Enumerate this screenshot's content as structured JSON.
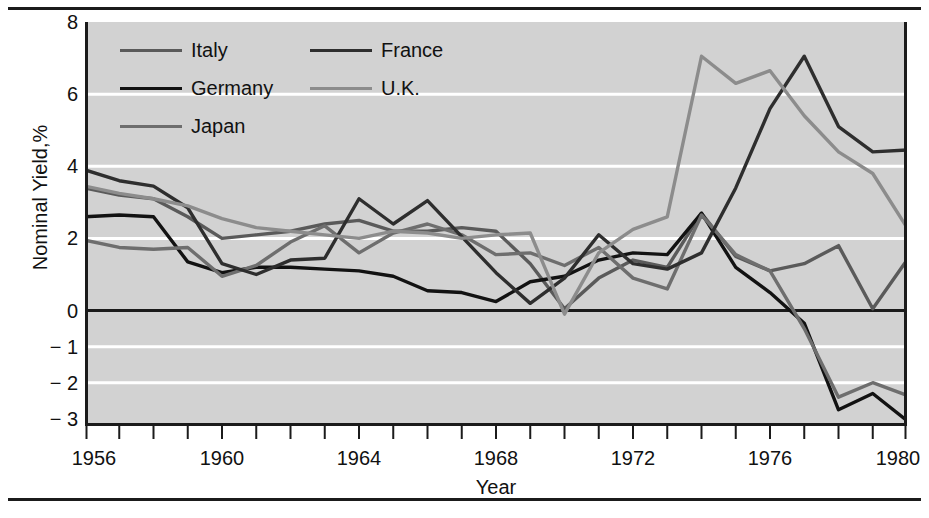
{
  "figure": {
    "background": "#ffffff",
    "plot_background": "#d2d2d2",
    "rule_color": "#1b1b1b"
  },
  "axes": {
    "ylabel": "Nominal Yield,%",
    "xlabel": "Year",
    "yticks": [
      "8",
      "6",
      "4",
      "2",
      "0",
      "− 1",
      "− 2",
      "− 3"
    ],
    "ytick_values": [
      8,
      6,
      4,
      2,
      0,
      -1,
      -2,
      -3
    ],
    "xticks": [
      "1956",
      "1960",
      "1964",
      "1968",
      "1972",
      "1976",
      "1980"
    ],
    "xtick_values": [
      1956,
      1960,
      1964,
      1968,
      1972,
      1976,
      1980
    ],
    "gridline_values": [
      6,
      4,
      2,
      -1,
      -2
    ],
    "zero_line_value": 0
  },
  "legend": {
    "entries": [
      {
        "label": "Italy",
        "color": "#5a5a5a",
        "width": 3.2,
        "column": 0,
        "row": 0
      },
      {
        "label": "Germany",
        "color": "#121212",
        "width": 3.6,
        "column": 0,
        "row": 1
      },
      {
        "label": "Japan",
        "color": "#6e6e6e",
        "width": 3.2,
        "column": 0,
        "row": 2
      },
      {
        "label": "France",
        "color": "#2e2e2e",
        "width": 3.6,
        "column": 1,
        "row": 0
      },
      {
        "label": "U.K.",
        "color": "#8c8c8c",
        "width": 3.2,
        "column": 1,
        "row": 1
      }
    ]
  },
  "chart_data": {
    "type": "line",
    "title": "",
    "xlabel": "Year",
    "ylabel": "Nominal Yield,%",
    "xlim": [
      1956,
      1980
    ],
    "ylim": [
      -3.2,
      8.0
    ],
    "grid": true,
    "grid_color": "#ffffff",
    "legend_position": "upper-left-inside",
    "x": [
      1956,
      1957,
      1958,
      1959,
      1960,
      1961,
      1962,
      1963,
      1964,
      1965,
      1966,
      1967,
      1968,
      1969,
      1970,
      1971,
      1972,
      1973,
      1974,
      1975,
      1976,
      1977,
      1978,
      1979,
      1980
    ],
    "series": [
      {
        "name": "Italy",
        "color": "#5a5a5a",
        "values": [
          3.4,
          3.2,
          3.1,
          2.6,
          2.0,
          2.1,
          2.2,
          2.4,
          2.5,
          2.2,
          2.2,
          2.3,
          2.2,
          1.3,
          0.05,
          0.9,
          1.4,
          1.2,
          2.7,
          1.5,
          1.1,
          1.3,
          1.8,
          0.05,
          1.4
        ]
      },
      {
        "name": "Germany",
        "color": "#121212",
        "values": [
          2.6,
          2.65,
          2.6,
          1.35,
          1.05,
          1.2,
          1.2,
          1.15,
          1.1,
          0.95,
          0.55,
          0.5,
          0.25,
          0.8,
          0.95,
          1.4,
          1.6,
          1.55,
          2.7,
          1.2,
          0.5,
          -0.35,
          -2.75,
          -2.3,
          -3.05
        ]
      },
      {
        "name": "Japan",
        "color": "#6e6e6e",
        "values": [
          1.95,
          1.75,
          1.7,
          1.75,
          0.95,
          1.25,
          1.9,
          2.35,
          1.6,
          2.15,
          2.4,
          2.1,
          1.55,
          1.6,
          1.25,
          1.75,
          0.9,
          0.6,
          2.65,
          1.55,
          1.1,
          -0.5,
          -2.4,
          -2.0,
          -2.35
        ]
      },
      {
        "name": "France",
        "color": "#2e2e2e",
        "values": [
          3.9,
          3.6,
          3.45,
          2.85,
          1.3,
          1.0,
          1.4,
          1.45,
          3.1,
          2.4,
          3.05,
          2.05,
          1.05,
          0.2,
          0.9,
          2.1,
          1.3,
          1.15,
          1.6,
          3.4,
          5.6,
          7.05,
          5.1,
          4.4,
          4.45
        ]
      },
      {
        "name": "U.K.",
        "color": "#8c8c8c",
        "values": [
          3.45,
          3.25,
          3.1,
          2.9,
          2.55,
          2.3,
          2.2,
          2.1,
          2.0,
          2.2,
          2.15,
          2.0,
          2.1,
          2.15,
          -0.1,
          1.6,
          2.25,
          2.6,
          7.05,
          6.3,
          6.65,
          5.4,
          4.4,
          3.8,
          2.3
        ]
      }
    ]
  }
}
